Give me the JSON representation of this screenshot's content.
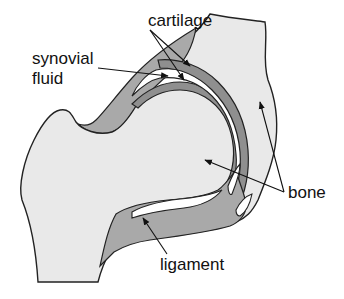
{
  "diagram": {
    "labels": {
      "cartilage": "cartilage",
      "synovial_line1": "synovial",
      "synovial_line2": "fluid",
      "bone": "bone",
      "ligament": "ligament"
    },
    "colors": {
      "background": "#ffffff",
      "bone_fill": "#e9e9e9",
      "ligament_fill": "#a9a9a9",
      "cartilage_fill": "#8f8f8f",
      "outline": "#222222",
      "text": "#111111"
    }
  }
}
